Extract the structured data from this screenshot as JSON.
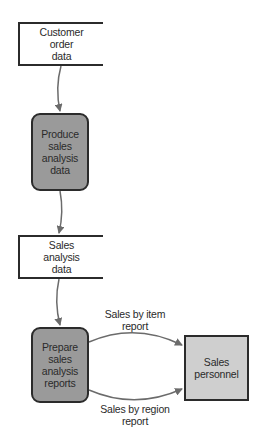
{
  "diagram": {
    "type": "data flow diagram",
    "colors": {
      "process_fill": "#9a9a9a",
      "entity_fill": "#cfcfcf",
      "datastore_fill": "#ffffff",
      "stroke": "#2b2b2b",
      "arrow": "#6b6b6b"
    },
    "nodes": {
      "customer_order_data": {
        "kind": "data-store",
        "label": "Customer\norder\ndata"
      },
      "produce_sales_analysis_data": {
        "kind": "process",
        "label": "Produce\nsales\nanalysis\ndata"
      },
      "sales_analysis_data": {
        "kind": "data-store",
        "label": "Sales\nanalysis\ndata"
      },
      "prepare_sales_analysis_reports": {
        "kind": "process",
        "label": "Prepare\nsales\nanalysis\nreports"
      },
      "sales_personnel": {
        "kind": "external-entity",
        "label": "Sales\npersonnel"
      }
    },
    "flows": [
      {
        "from": "customer_order_data",
        "to": "produce_sales_analysis_data",
        "label": ""
      },
      {
        "from": "produce_sales_analysis_data",
        "to": "sales_analysis_data",
        "label": ""
      },
      {
        "from": "sales_analysis_data",
        "to": "prepare_sales_analysis_reports",
        "label": ""
      },
      {
        "from": "prepare_sales_analysis_reports",
        "to": "sales_personnel",
        "label": "Sales by item\nreport"
      },
      {
        "from": "prepare_sales_analysis_reports",
        "to": "sales_personnel",
        "label": "Sales by region\nreport"
      }
    ]
  }
}
